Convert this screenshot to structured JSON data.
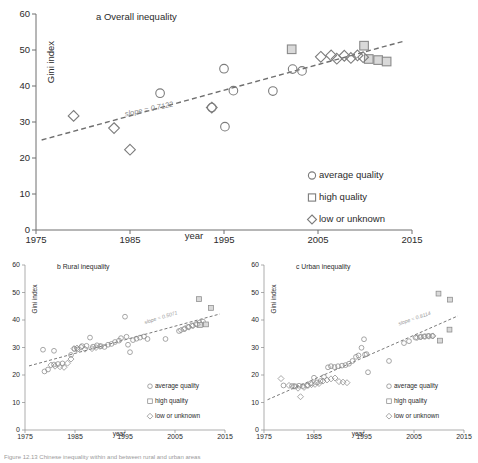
{
  "figure": {
    "caption": "Figure 12.13 Chinese inequality within and between rural and urban areas"
  },
  "legend": {
    "items": [
      {
        "marker": "circle",
        "label": "average quality"
      },
      {
        "marker": "square",
        "label": "high quality"
      },
      {
        "marker": "diamond",
        "label": "low or unknown"
      }
    ]
  },
  "chart_data": [
    {
      "id": "panel-a",
      "type": "scatter",
      "title": "a Overall inequality",
      "xlabel": "year",
      "ylabel": "Gini index",
      "xlim": [
        1975,
        2015
      ],
      "ylim": [
        0,
        60
      ],
      "xticks": [
        1975,
        1985,
        1995,
        2005,
        2015
      ],
      "yticks": [
        0,
        10,
        20,
        30,
        40,
        50,
        60
      ],
      "grid": false,
      "legend_position": "bottom-right",
      "annotations": [
        {
          "text": "slope = 0.7122",
          "x": 1984.5,
          "y": 31.5,
          "rotation": -12
        }
      ],
      "trendline": {
        "slope": 0.7122,
        "x0": 1975.6,
        "y0": 25.0,
        "x1": 2014.2,
        "y1": 52.5
      },
      "series": [
        {
          "name": "average quality",
          "marker": "circle",
          "points": [
            {
              "x": 1988.2,
              "y": 38.0
            },
            {
              "x": 1993.7,
              "y": 34.0
            },
            {
              "x": 1995.0,
              "y": 44.8
            },
            {
              "x": 1995.1,
              "y": 28.7
            },
            {
              "x": 1996.0,
              "y": 38.7
            },
            {
              "x": 2000.2,
              "y": 38.6
            },
            {
              "x": 2002.3,
              "y": 44.7
            },
            {
              "x": 2003.3,
              "y": 44.2
            }
          ]
        },
        {
          "name": "high quality",
          "marker": "square",
          "points": [
            {
              "x": 2002.2,
              "y": 50.2
            },
            {
              "x": 2009.9,
              "y": 51.2
            },
            {
              "x": 2010.4,
              "y": 47.5
            },
            {
              "x": 2011.4,
              "y": 47.2
            },
            {
              "x": 2012.3,
              "y": 46.8
            }
          ]
        },
        {
          "name": "low or unknown",
          "marker": "diamond",
          "points": [
            {
              "x": 1979.0,
              "y": 31.7
            },
            {
              "x": 1983.3,
              "y": 28.3
            },
            {
              "x": 1985.0,
              "y": 22.3
            },
            {
              "x": 1993.7,
              "y": 34.0
            },
            {
              "x": 2005.3,
              "y": 48.1
            },
            {
              "x": 2006.4,
              "y": 48.5
            },
            {
              "x": 2007.0,
              "y": 47.6
            },
            {
              "x": 2007.8,
              "y": 48.4
            },
            {
              "x": 2008.5,
              "y": 47.8
            },
            {
              "x": 2009.2,
              "y": 48.5
            },
            {
              "x": 2009.8,
              "y": 48.0
            }
          ]
        }
      ]
    },
    {
      "id": "panel-b",
      "type": "scatter",
      "title": "b Rural inequality",
      "xlabel": "year",
      "ylabel": "Gini index",
      "xlim": [
        1975,
        2015
      ],
      "ylim": [
        0,
        60
      ],
      "xticks": [
        1975,
        1985,
        1995,
        2005,
        2015
      ],
      "yticks": [
        0,
        10,
        20,
        30,
        40,
        50,
        60
      ],
      "grid": false,
      "legend_position": "bottom-right",
      "annotations": [
        {
          "text": "slope = 0.5071",
          "x": 1999.0,
          "y": 38.5,
          "rotation": -17
        }
      ],
      "trendline": {
        "slope": 0.5071,
        "x0": 1975.8,
        "y0": 23.3,
        "x1": 2014.0,
        "y1": 42.2
      },
      "series": [
        {
          "name": "average quality",
          "marker": "circle",
          "points": [
            {
              "x": 1978.6,
              "y": 29.2
            },
            {
              "x": 1980.8,
              "y": 28.8
            },
            {
              "x": 1978.9,
              "y": 21.3
            },
            {
              "x": 1979.6,
              "y": 22.0
            },
            {
              "x": 1980.8,
              "y": 23.8
            },
            {
              "x": 1981.6,
              "y": 24.0
            },
            {
              "x": 1982.5,
              "y": 24.2
            },
            {
              "x": 1984.2,
              "y": 27.3
            },
            {
              "x": 1984.9,
              "y": 29.5
            },
            {
              "x": 1985.5,
              "y": 29.3
            },
            {
              "x": 1986.4,
              "y": 30.5
            },
            {
              "x": 1987.3,
              "y": 30.6
            },
            {
              "x": 1988.0,
              "y": 33.6
            },
            {
              "x": 1988.6,
              "y": 30.3
            },
            {
              "x": 1989.4,
              "y": 30.8
            },
            {
              "x": 1990.2,
              "y": 30.5
            },
            {
              "x": 1990.9,
              "y": 30.2
            },
            {
              "x": 1991.6,
              "y": 31.0
            },
            {
              "x": 1992.3,
              "y": 31.3
            },
            {
              "x": 1993.0,
              "y": 32.0
            },
            {
              "x": 1993.8,
              "y": 32.5
            },
            {
              "x": 1994.2,
              "y": 33.4
            },
            {
              "x": 1995.0,
              "y": 41.2
            },
            {
              "x": 1995.3,
              "y": 33.9
            },
            {
              "x": 1995.6,
              "y": 31.0
            },
            {
              "x": 1996.0,
              "y": 28.3
            },
            {
              "x": 1996.6,
              "y": 32.7
            },
            {
              "x": 1997.3,
              "y": 33.2
            },
            {
              "x": 1998.0,
              "y": 33.6
            },
            {
              "x": 1998.8,
              "y": 34.0
            },
            {
              "x": 1999.5,
              "y": 33.1
            },
            {
              "x": 2003.1,
              "y": 33.1
            },
            {
              "x": 2005.8,
              "y": 36.0
            },
            {
              "x": 2006.8,
              "y": 36.7
            },
            {
              "x": 2007.6,
              "y": 37.5
            },
            {
              "x": 2008.4,
              "y": 38.0
            },
            {
              "x": 2009.2,
              "y": 38.5
            },
            {
              "x": 2009.9,
              "y": 39.0
            },
            {
              "x": 2010.6,
              "y": 39.4
            }
          ]
        },
        {
          "name": "high quality",
          "marker": "square",
          "points": [
            {
              "x": 2009.8,
              "y": 47.6
            },
            {
              "x": 2012.2,
              "y": 44.4
            },
            {
              "x": 2010.0,
              "y": 38.2
            },
            {
              "x": 2011.2,
              "y": 38.4
            }
          ]
        },
        {
          "name": "low or unknown",
          "marker": "diamond",
          "points": [
            {
              "x": 1980.2,
              "y": 23.6
            },
            {
              "x": 1981.0,
              "y": 23.2
            },
            {
              "x": 1982.0,
              "y": 23.0
            },
            {
              "x": 1982.8,
              "y": 22.8
            },
            {
              "x": 1983.5,
              "y": 24.3
            },
            {
              "x": 1984.2,
              "y": 25.8
            },
            {
              "x": 1984.8,
              "y": 29.6
            },
            {
              "x": 1985.4,
              "y": 29.8
            },
            {
              "x": 1986.2,
              "y": 30.1
            },
            {
              "x": 1987.0,
              "y": 29.4
            },
            {
              "x": 1988.4,
              "y": 29.6
            },
            {
              "x": 1989.2,
              "y": 30.0
            },
            {
              "x": 1990.0,
              "y": 30.4
            },
            {
              "x": 2006.2,
              "y": 36.3
            },
            {
              "x": 2007.0,
              "y": 36.9
            },
            {
              "x": 2007.8,
              "y": 37.4
            },
            {
              "x": 2008.6,
              "y": 37.9
            },
            {
              "x": 2009.4,
              "y": 38.4
            }
          ]
        }
      ]
    },
    {
      "id": "panel-c",
      "type": "scatter",
      "title": "c Urban inequality",
      "xlabel": "year",
      "ylabel": "Gini index",
      "xlim": [
        1975,
        2015
      ],
      "ylim": [
        0,
        60
      ],
      "xticks": [
        1975,
        1985,
        1995,
        2005,
        2015
      ],
      "yticks": [
        0,
        10,
        20,
        30,
        40,
        50,
        60
      ],
      "grid": false,
      "legend_position": "bottom-right",
      "annotations": [
        {
          "text": "slope = 0.8114",
          "x": 2002.0,
          "y": 38.0,
          "rotation": -19
        }
      ],
      "trendline": {
        "slope": 0.8114,
        "x0": 1975.7,
        "y0": 11.0,
        "x1": 2013.8,
        "y1": 41.5
      },
      "series": [
        {
          "name": "average quality",
          "marker": "circle",
          "points": [
            {
              "x": 1978.9,
              "y": 16.2
            },
            {
              "x": 1980.6,
              "y": 16.0
            },
            {
              "x": 1981.3,
              "y": 15.9
            },
            {
              "x": 1982.0,
              "y": 16.1
            },
            {
              "x": 1982.8,
              "y": 16.0
            },
            {
              "x": 1983.6,
              "y": 16.2
            },
            {
              "x": 1984.4,
              "y": 17.0
            },
            {
              "x": 1985.0,
              "y": 19.0
            },
            {
              "x": 1985.6,
              "y": 17.3
            },
            {
              "x": 1986.3,
              "y": 17.8
            },
            {
              "x": 1987.0,
              "y": 19.3
            },
            {
              "x": 1987.8,
              "y": 22.8
            },
            {
              "x": 1988.4,
              "y": 23.2
            },
            {
              "x": 1989.1,
              "y": 22.9
            },
            {
              "x": 1989.8,
              "y": 23.2
            },
            {
              "x": 1990.6,
              "y": 23.4
            },
            {
              "x": 1991.3,
              "y": 23.6
            },
            {
              "x": 1992.0,
              "y": 24.1
            },
            {
              "x": 1992.7,
              "y": 25.1
            },
            {
              "x": 1993.4,
              "y": 26.6
            },
            {
              "x": 1993.9,
              "y": 27.1
            },
            {
              "x": 1994.5,
              "y": 29.9
            },
            {
              "x": 1995.0,
              "y": 33.0
            },
            {
              "x": 1995.2,
              "y": 27.4
            },
            {
              "x": 1995.5,
              "y": 27.6
            },
            {
              "x": 1995.8,
              "y": 21.0
            },
            {
              "x": 2000.0,
              "y": 25.1
            },
            {
              "x": 2003.0,
              "y": 31.6
            },
            {
              "x": 2004.0,
              "y": 32.3
            },
            {
              "x": 2005.3,
              "y": 33.6
            },
            {
              "x": 2006.2,
              "y": 33.8
            },
            {
              "x": 2007.0,
              "y": 34.0
            },
            {
              "x": 2007.8,
              "y": 34.2
            },
            {
              "x": 2008.6,
              "y": 34.2
            }
          ]
        },
        {
          "name": "high quality",
          "marker": "square",
          "points": [
            {
              "x": 2009.9,
              "y": 49.6
            },
            {
              "x": 2012.2,
              "y": 47.4
            },
            {
              "x": 2012.1,
              "y": 36.5
            },
            {
              "x": 2010.2,
              "y": 32.5
            }
          ]
        },
        {
          "name": "low or unknown",
          "marker": "diamond",
          "points": [
            {
              "x": 1978.4,
              "y": 18.7
            },
            {
              "x": 1980.0,
              "y": 16.2
            },
            {
              "x": 1981.0,
              "y": 15.9
            },
            {
              "x": 1981.8,
              "y": 15.2
            },
            {
              "x": 1982.3,
              "y": 12.1
            },
            {
              "x": 1983.0,
              "y": 15.5
            },
            {
              "x": 1983.8,
              "y": 16.2
            },
            {
              "x": 1984.5,
              "y": 16.5
            },
            {
              "x": 1985.2,
              "y": 16.6
            },
            {
              "x": 1986.0,
              "y": 16.9
            },
            {
              "x": 1986.8,
              "y": 17.8
            },
            {
              "x": 1987.6,
              "y": 18.2
            },
            {
              "x": 1988.4,
              "y": 18.6
            },
            {
              "x": 1989.2,
              "y": 18.9
            },
            {
              "x": 1990.0,
              "y": 17.6
            },
            {
              "x": 1990.8,
              "y": 17.4
            },
            {
              "x": 1991.6,
              "y": 17.2
            },
            {
              "x": 2005.6,
              "y": 33.6
            },
            {
              "x": 2006.4,
              "y": 33.9
            },
            {
              "x": 2007.2,
              "y": 34.0
            },
            {
              "x": 2008.0,
              "y": 34.1
            },
            {
              "x": 2008.8,
              "y": 34.2
            }
          ]
        }
      ]
    }
  ]
}
